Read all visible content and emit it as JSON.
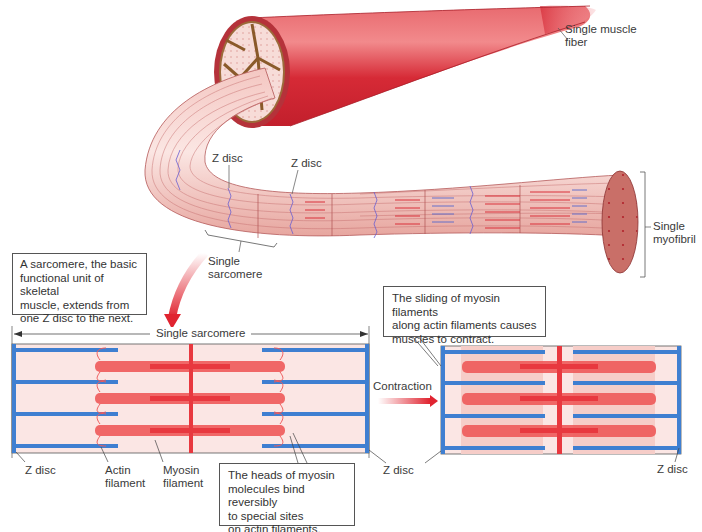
{
  "figure": {
    "type": "muscle-structure-diagram",
    "colors": {
      "muscle_red": "#d8303a",
      "myofibril_pink": "#e8a8a0",
      "actin_blue": "#3f7fd1",
      "myosin_red": "#ef5a5a",
      "sarcomere_bg": "#fbe6e4",
      "zdisc_blue": "#3f7fd1",
      "callout_border": "#555555"
    }
  },
  "labels": {
    "single_muscle_fiber": "Single muscle\nfiber",
    "single_myofibril": "Single\nmyofibril",
    "z_disc_top_1": "Z disc",
    "z_disc_top_2": "Z disc",
    "single_sarcomere_top": "Single\nsarcomere",
    "single_sarcomere_span": "Single sarcomere",
    "contraction": "Contraction",
    "z_disc_bottom_left": "Z disc",
    "actin_filament": "Actin\nfilament",
    "myosin_filament": "Myosin\nfilament",
    "z_disc_bottom_mid": "Z disc",
    "z_disc_bottom_right": "Z disc"
  },
  "callouts": {
    "sarcomere_definition": "A sarcomere, the basic\nfunctional unit of skeletal\nmuscle, extends from\none Z disc to the next.",
    "sliding": "The sliding of myosin filaments\nalong actin filaments causes\nmuscles to contract.",
    "myosin_heads": "The heads of myosin\nmolecules bind reversibly\nto special sites\non actin filaments."
  }
}
